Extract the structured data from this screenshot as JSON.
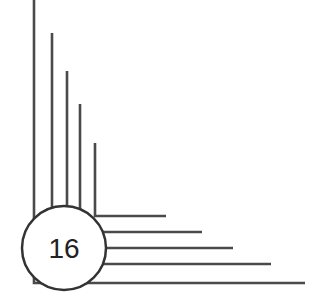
{
  "page_number": {
    "label": "16"
  },
  "ornament": {
    "line_color": "#4a4a4a",
    "circle_stroke": "#333333",
    "circle_fill": "#ffffff",
    "text_color": "#222222",
    "vertical_lines": [
      {
        "x": 34,
        "y_top": 0
      },
      {
        "x": 52,
        "y_top": 33
      },
      {
        "x": 67,
        "y_top": 71
      },
      {
        "x": 80,
        "y_top": 104
      },
      {
        "x": 95,
        "y_top": 143
      }
    ],
    "horizontal_lines": [
      {
        "y": 216,
        "x_end": 166
      },
      {
        "y": 232,
        "x_end": 202
      },
      {
        "y": 248,
        "x_end": 233
      },
      {
        "y": 264,
        "x_end": 271
      },
      {
        "y": 283,
        "x_end": 305
      }
    ],
    "circle": {
      "cx": 64,
      "cy": 248,
      "r": 42
    }
  }
}
